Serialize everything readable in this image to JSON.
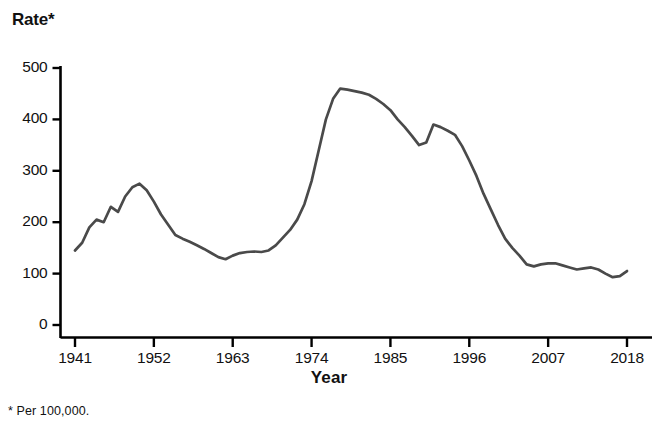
{
  "chart_data": {
    "type": "line",
    "title": "",
    "ylabel": "Rate*",
    "xlabel": "Year",
    "footnote": "* Per 100,000.",
    "ylim": [
      0,
      500
    ],
    "xlim": [
      1941,
      2018
    ],
    "grid": false,
    "legend": "none",
    "line_color": "#4a4a4a",
    "axis_color": "#000000",
    "yticks": [
      "0",
      "100",
      "200",
      "300",
      "400",
      "500"
    ],
    "ytick_values": [
      0,
      100,
      200,
      300,
      400,
      500
    ],
    "xticks": [
      "1941",
      "1952",
      "1963",
      "1974",
      "1985",
      "1996",
      "2007",
      "2018"
    ],
    "xtick_values": [
      1941,
      1952,
      1963,
      1974,
      1985,
      1996,
      2007,
      2018
    ],
    "series": [
      {
        "name": "Rate per 100,000",
        "x": [
          1941,
          1942,
          1943,
          1944,
          1945,
          1946,
          1947,
          1948,
          1949,
          1950,
          1951,
          1952,
          1953,
          1954,
          1955,
          1956,
          1957,
          1958,
          1959,
          1960,
          1961,
          1962,
          1963,
          1964,
          1965,
          1966,
          1967,
          1968,
          1969,
          1970,
          1971,
          1972,
          1973,
          1974,
          1975,
          1976,
          1977,
          1978,
          1979,
          1980,
          1981,
          1982,
          1983,
          1984,
          1985,
          1986,
          1987,
          1988,
          1989,
          1990,
          1991,
          1992,
          1993,
          1994,
          1995,
          1996,
          1997,
          1998,
          1999,
          2000,
          2001,
          2002,
          2003,
          2004,
          2005,
          2006,
          2007,
          2008,
          2009,
          2010,
          2011,
          2012,
          2013,
          2014,
          2015,
          2016,
          2017,
          2018
        ],
        "values": [
          145,
          160,
          190,
          205,
          200,
          230,
          220,
          250,
          268,
          275,
          262,
          240,
          215,
          195,
          175,
          168,
          162,
          155,
          148,
          140,
          132,
          128,
          135,
          140,
          142,
          143,
          142,
          145,
          155,
          170,
          185,
          205,
          235,
          280,
          340,
          400,
          440,
          460,
          458,
          455,
          452,
          448,
          440,
          430,
          418,
          400,
          385,
          368,
          350,
          355,
          390,
          385,
          378,
          370,
          348,
          320,
          290,
          255,
          225,
          195,
          168,
          150,
          135,
          118,
          114,
          118,
          120,
          120,
          116,
          112,
          108,
          110,
          112,
          108,
          100,
          93,
          95,
          105
        ]
      }
    ]
  },
  "axis_titles": {
    "y": "Rate*",
    "x": "Year"
  },
  "footnote_text": "* Per 100,000."
}
